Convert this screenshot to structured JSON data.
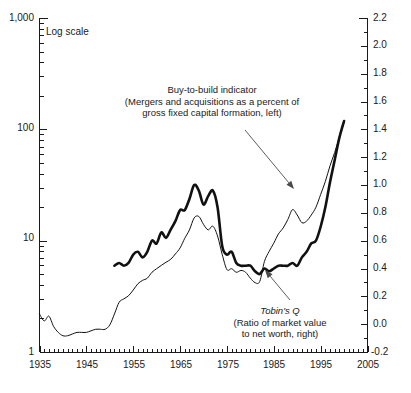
{
  "chart_data": {
    "type": "line",
    "title": "",
    "note": "Log scale",
    "xlabel": "",
    "ylabel": "",
    "y_left_label": "",
    "y_right_label": "",
    "grid": false,
    "legend_position": "annotations",
    "x_axis": {
      "min": 1935,
      "max": 2005,
      "tick_interval": 1,
      "labeled_ticks": [
        1935,
        1945,
        1955,
        1965,
        1975,
        1985,
        1995,
        2005
      ],
      "tick_labels": [
        "1935",
        "1945",
        "1955",
        "1965",
        "1975",
        "1985",
        "1995",
        "2005"
      ]
    },
    "y_left": {
      "scale": "log",
      "min": 1,
      "max": 1000,
      "labeled_ticks": [
        1,
        10,
        100,
        1000
      ],
      "tick_labels": [
        "1",
        "10",
        "100",
        "1,000"
      ]
    },
    "y_right": {
      "scale": "linear",
      "min": -0.2,
      "max": 2.2,
      "tick_interval": 0.2,
      "labeled_ticks": [
        -0.2,
        0.0,
        0.2,
        0.4,
        0.6,
        0.8,
        1.0,
        1.2,
        1.4,
        1.6,
        1.8,
        2.0,
        2.2
      ],
      "tick_labels": [
        "-0.2",
        "0.0",
        "0.2",
        "0.4",
        "0.6",
        "0.8",
        "1.0",
        "1.2",
        "1.4",
        "1.6",
        "1.8",
        "2.0",
        "2.2"
      ]
    },
    "series": [
      {
        "name": "Buy-to-build indicator",
        "axis": "left",
        "style": "thin",
        "x": [
          1935,
          1936,
          1937,
          1938,
          1939,
          1940,
          1941,
          1942,
          1943,
          1944,
          1945,
          1946,
          1947,
          1948,
          1949,
          1950,
          1951,
          1952,
          1953,
          1954,
          1955,
          1956,
          1957,
          1958,
          1959,
          1960,
          1961,
          1962,
          1963,
          1964,
          1965,
          1966,
          1967,
          1968,
          1969,
          1970,
          1971,
          1972,
          1973,
          1974,
          1975,
          1976,
          1977,
          1978,
          1979,
          1980,
          1981,
          1982,
          1983,
          1984,
          1985,
          1986,
          1987,
          1988,
          1989,
          1990,
          1991,
          1992,
          1993,
          1994,
          1995,
          1996,
          1997,
          1998,
          1999,
          2000
        ],
        "values": [
          2.2,
          1.9,
          2.1,
          1.7,
          1.5,
          1.4,
          1.4,
          1.45,
          1.5,
          1.5,
          1.5,
          1.55,
          1.6,
          1.6,
          1.6,
          1.75,
          2.2,
          2.8,
          3.0,
          3.2,
          3.6,
          4.1,
          4.4,
          4.6,
          5.2,
          5.6,
          6.0,
          6.4,
          6.8,
          7.6,
          8.6,
          10.5,
          12.5,
          16.0,
          16.5,
          14.0,
          12.5,
          13.5,
          11.0,
          7.5,
          5.5,
          5.6,
          5.2,
          5.4,
          5.2,
          4.6,
          4.2,
          4.3,
          6.5,
          8.0,
          9.5,
          11.5,
          13.0,
          15.5,
          19.0,
          17.0,
          14.5,
          15.0,
          17.0,
          20.0,
          26.0,
          34.0,
          47.0,
          62.0,
          85.0,
          115.0
        ]
      },
      {
        "name": "Tobin's Q",
        "axis": "right",
        "style": "thick",
        "x": [
          1951,
          1952,
          1953,
          1954,
          1955,
          1956,
          1957,
          1958,
          1959,
          1960,
          1961,
          1962,
          1963,
          1964,
          1965,
          1966,
          1967,
          1968,
          1969,
          1970,
          1971,
          1972,
          1973,
          1974,
          1975,
          1976,
          1977,
          1978,
          1979,
          1980,
          1981,
          1982,
          1983,
          1984,
          1985,
          1986,
          1987,
          1988,
          1989,
          1990,
          1991,
          1992,
          1993,
          1994,
          1995,
          1996,
          1997,
          1998,
          1999,
          2000
        ],
        "values": [
          0.42,
          0.44,
          0.42,
          0.44,
          0.5,
          0.52,
          0.48,
          0.52,
          0.6,
          0.58,
          0.66,
          0.62,
          0.68,
          0.74,
          0.82,
          0.82,
          0.9,
          1.0,
          0.96,
          0.86,
          0.92,
          0.96,
          0.84,
          0.56,
          0.5,
          0.52,
          0.44,
          0.42,
          0.42,
          0.42,
          0.38,
          0.36,
          0.4,
          0.38,
          0.4,
          0.42,
          0.42,
          0.42,
          0.44,
          0.42,
          0.48,
          0.52,
          0.58,
          0.6,
          0.7,
          0.84,
          1.02,
          1.18,
          1.34,
          1.46
        ]
      }
    ],
    "annotations": [
      {
        "id": "buy-to-build",
        "lines": [
          "Buy-to-build indicator",
          "(Mergers and acquisitions as a percent of",
          "gross fixed capital formation, left)"
        ],
        "arrow": {
          "from_x": 245,
          "from_y": 130,
          "to_x": 294,
          "to_y": 189
        }
      },
      {
        "id": "tobins-q",
        "lines": [
          "Tobin's Q",
          "(Ratio of market value",
          "to net worth, right)"
        ],
        "italic_first_line": true,
        "arrow": {
          "from_x": 290,
          "from_y": 300,
          "to_x": 265,
          "to_y": 270
        }
      }
    ],
    "colors": {
      "line": "#111111",
      "axis": "#1a1a1a",
      "arrow": "#4a4a4a",
      "background": "#ffffff"
    }
  }
}
